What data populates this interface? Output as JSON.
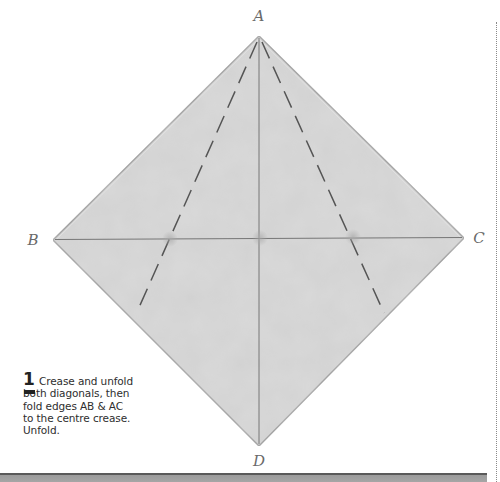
{
  "diagram": {
    "paper_color": "#cfcfcf",
    "corners": {
      "A": {
        "label": "A",
        "x": 259,
        "y": 36
      },
      "B": {
        "label": "B",
        "x": 53,
        "y": 240
      },
      "C": {
        "label": "C",
        "x": 464,
        "y": 238
      },
      "D": {
        "label": "D",
        "x": 259,
        "y": 446
      }
    },
    "corner_labels": [
      {
        "key": "A",
        "text": "A",
        "x": 259,
        "y": 16
      },
      {
        "key": "B",
        "text": "B",
        "x": 33,
        "y": 240
      },
      {
        "key": "C",
        "text": "C",
        "x": 479,
        "y": 238
      },
      {
        "key": "D",
        "text": "D",
        "x": 259,
        "y": 461
      }
    ],
    "creases": {
      "horizontal": "B-C diagonal (solid)",
      "vertical": "A-D diagonal (solid)",
      "dashed": [
        "fold line from A to edge BD",
        "fold line from A to edge CD"
      ]
    }
  },
  "step": {
    "number": "1",
    "text": "Crease and unfold both diagonals, then fold edges AB & AC to the centre crease. Unfold."
  }
}
